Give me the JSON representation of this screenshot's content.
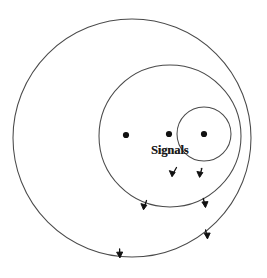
{
  "figure": {
    "background_color": "#ffffff",
    "line_color": "#4a4a4a",
    "marker_color": "#111111",
    "label": "Signals",
    "label_x": 151,
    "label_y": 144
  },
  "chart_data": {
    "type": "diagram",
    "title": "",
    "subtitle": "",
    "xlabel": "",
    "ylabel": "",
    "grid": false,
    "legend_position": "none",
    "annotations": [
      {
        "name": "signals-label",
        "text": "Signals",
        "x": 151,
        "y": 144,
        "font_weight": "bold",
        "font_style": "serif"
      }
    ],
    "circles": [
      {
        "name": "outer-wavefront",
        "cx": 132,
        "cy": 138,
        "r": 119,
        "stroke": "#4a4a4a",
        "stroke_width": 1.05
      },
      {
        "name": "middle-wavefront",
        "cx": 170,
        "cy": 136,
        "r": 71,
        "stroke": "#4a4a4a",
        "stroke_width": 1.05
      },
      {
        "name": "inner-wavefront",
        "cx": 204,
        "cy": 134,
        "r": 27,
        "stroke": "#4a4a4a",
        "stroke_width": 1.05
      }
    ],
    "points": [
      {
        "name": "source-dot-1",
        "x": 126,
        "y": 135,
        "r": 3.1
      },
      {
        "name": "source-dot-2",
        "x": 169,
        "y": 134,
        "r": 3.1
      },
      {
        "name": "source-dot-3",
        "x": 204,
        "y": 134,
        "r": 3.1
      }
    ],
    "arrows": [
      {
        "name": "arrow-inner-left",
        "x": 173,
        "y": 174,
        "angle": 118
      },
      {
        "name": "arrow-inner-right",
        "x": 200,
        "y": 175,
        "angle": 96
      },
      {
        "name": "arrow-middle-left",
        "x": 144,
        "y": 207,
        "angle": 112
      },
      {
        "name": "arrow-middle-right",
        "x": 205,
        "y": 205,
        "angle": 80
      },
      {
        "name": "arrow-outer-right",
        "x": 207,
        "y": 237,
        "angle": 78
      },
      {
        "name": "arrow-outer-bottom",
        "x": 120,
        "y": 256,
        "angle": 100
      }
    ]
  }
}
